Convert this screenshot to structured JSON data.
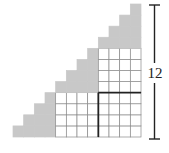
{
  "diagram": {
    "type": "staircase-grid",
    "columns": 12,
    "rows": 12,
    "column_heights": [
      1,
      2,
      3,
      4,
      5,
      6,
      7,
      8,
      9,
      10,
      11,
      12
    ],
    "white_regions": [
      {
        "name": "bottom-block",
        "col_start": 5,
        "col_end": 12,
        "row_start": 1,
        "row_end": 4
      },
      {
        "name": "right-block",
        "col_start": 9,
        "col_end": 12,
        "row_start": 5,
        "row_end": 8
      }
    ],
    "bold_corner": {
      "col": 9,
      "row_top": 4
    },
    "height_label": "12",
    "colors": {
      "shaded": "#c8c8c8",
      "grid_line": "#8a8a8a",
      "bold_line": "#222222",
      "bracket": "#222222"
    }
  }
}
